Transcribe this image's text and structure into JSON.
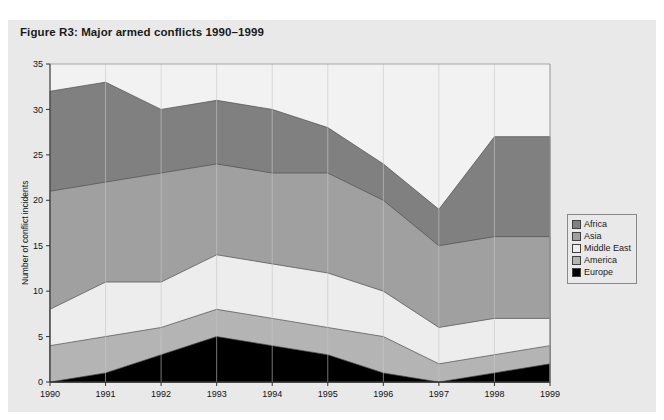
{
  "figure": {
    "caption": "Figure R3: Major armed conflicts 1990–1999",
    "panel_bg": "#e9e9e9",
    "page_bg": "#ffffff"
  },
  "legend": {
    "position": "right",
    "items": [
      {
        "label": "Africa",
        "color": "#808080"
      },
      {
        "label": "Asia",
        "color": "#a0a0a0"
      },
      {
        "label": "Middle East",
        "color": "#ededed"
      },
      {
        "label": "America",
        "color": "#b4b4b4"
      },
      {
        "label": "Europe",
        "color": "#000000"
      }
    ]
  },
  "axes": {
    "y_title": "Number of conflict incidents",
    "y_ticks": [
      "0",
      "5",
      "10",
      "15",
      "20",
      "25",
      "30",
      "35"
    ],
    "x_ticks": [
      "1990",
      "1991",
      "1992",
      "1993",
      "1994",
      "1995",
      "1996",
      "1997",
      "1998",
      "1999"
    ]
  },
  "chart_data": {
    "type": "area",
    "title": "Figure R3: Major armed conflicts 1990–1999",
    "xlabel": "",
    "ylabel": "Number of conflict incidents",
    "ylim": [
      0,
      35
    ],
    "grid": true,
    "stacked": true,
    "legend_position": "right",
    "categories": [
      "1990",
      "1991",
      "1992",
      "1993",
      "1994",
      "1995",
      "1996",
      "1997",
      "1998",
      "1999"
    ],
    "series": [
      {
        "name": "Europe",
        "color": "#000000",
        "values": [
          0,
          1,
          3,
          5,
          4,
          3,
          1,
          0,
          1,
          2
        ]
      },
      {
        "name": "America",
        "color": "#b4b4b4",
        "values": [
          4,
          4,
          3,
          3,
          3,
          3,
          4,
          2,
          2,
          2
        ]
      },
      {
        "name": "Middle East",
        "color": "#ededed",
        "values": [
          4,
          6,
          5,
          6,
          6,
          6,
          5,
          4,
          4,
          3
        ]
      },
      {
        "name": "Asia",
        "color": "#a0a0a0",
        "values": [
          13,
          11,
          12,
          10,
          10,
          11,
          10,
          9,
          9,
          9
        ]
      },
      {
        "name": "Africa",
        "color": "#808080",
        "values": [
          11,
          11,
          7,
          7,
          7,
          5,
          4,
          4,
          11,
          11
        ]
      }
    ],
    "cumulative_tops": {
      "Europe": [
        0,
        1,
        3,
        5,
        4,
        3,
        1,
        0,
        1,
        2
      ],
      "America": [
        4,
        5,
        6,
        8,
        7,
        6,
        5,
        2,
        3,
        4
      ],
      "Middle East": [
        8,
        11,
        11,
        14,
        13,
        12,
        10,
        6,
        7,
        7
      ],
      "Asia": [
        21,
        22,
        23,
        24,
        23,
        23,
        20,
        15,
        16,
        16
      ],
      "Africa": [
        32,
        33,
        30,
        31,
        30,
        28,
        24,
        19,
        27,
        27
      ]
    }
  }
}
